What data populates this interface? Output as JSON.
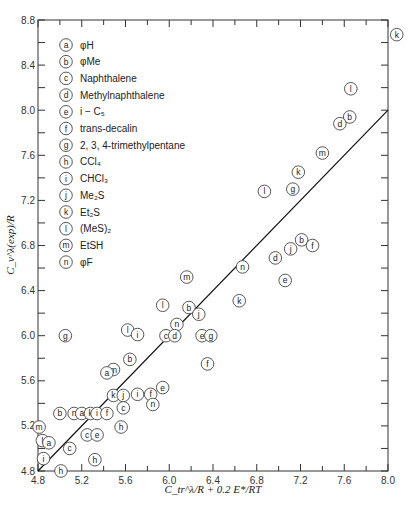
{
  "chart_data": {
    "type": "scatter",
    "title": "",
    "xlabel": "C_tr^λ/R + 0.2 E*/RT",
    "ylabel": "C_v^λ(exp)/R",
    "xlim": [
      4.8,
      8.0
    ],
    "ylim": [
      4.8,
      8.8
    ],
    "xticks": [
      "4.8",
      "5.2",
      "5.6",
      "6.0",
      "6.4",
      "6.8",
      "7.2",
      "7.6",
      "8.0"
    ],
    "yticks": [
      "4.8",
      "5.2",
      "5.6",
      "6.0",
      "6.4",
      "6.8",
      "7.2",
      "7.6",
      "8.0",
      "8.4",
      "8.8"
    ],
    "grid": false,
    "legend_position": "upper-left",
    "legend": [
      {
        "marker": "a",
        "label": "φH"
      },
      {
        "marker": "b",
        "label": "φMe"
      },
      {
        "marker": "c",
        "label": "Naphthalene"
      },
      {
        "marker": "d",
        "label": "Methylnaphthalene"
      },
      {
        "marker": "e",
        "label": "i − C₅"
      },
      {
        "marker": "f",
        "label": "trans-decalin"
      },
      {
        "marker": "g",
        "label": "2, 3, 4-trimethylpentane"
      },
      {
        "marker": "h",
        "label": "CCl₄"
      },
      {
        "marker": "i",
        "label": "CHCl₃"
      },
      {
        "marker": "j",
        "label": "Me₂S"
      },
      {
        "marker": "k",
        "label": "Et₂S"
      },
      {
        "marker": "l",
        "label": "(MeS)₂"
      },
      {
        "marker": "m",
        "label": "EtSH"
      },
      {
        "marker": "n",
        "label": "φF"
      }
    ],
    "reference_line": {
      "label": "y = x",
      "x": [
        4.8,
        8.0
      ],
      "y": [
        4.8,
        8.0
      ]
    },
    "points": [
      {
        "m": "k",
        "x": 8.08,
        "y": 8.67
      },
      {
        "m": "l",
        "x": 7.66,
        "y": 8.19
      },
      {
        "m": "b",
        "x": 7.65,
        "y": 7.94
      },
      {
        "m": "d",
        "x": 7.56,
        "y": 7.88
      },
      {
        "m": "m",
        "x": 7.4,
        "y": 7.62
      },
      {
        "m": "k",
        "x": 7.18,
        "y": 7.45
      },
      {
        "m": "g",
        "x": 7.13,
        "y": 7.3
      },
      {
        "m": "l",
        "x": 6.87,
        "y": 7.28
      },
      {
        "m": "b",
        "x": 7.21,
        "y": 6.85
      },
      {
        "m": "j",
        "x": 7.11,
        "y": 6.77
      },
      {
        "m": "f",
        "x": 7.31,
        "y": 6.8
      },
      {
        "m": "d",
        "x": 6.97,
        "y": 6.69
      },
      {
        "m": "e",
        "x": 7.06,
        "y": 6.49
      },
      {
        "m": "n",
        "x": 6.67,
        "y": 6.61
      },
      {
        "m": "m",
        "x": 6.16,
        "y": 6.52
      },
      {
        "m": "l",
        "x": 5.94,
        "y": 6.27
      },
      {
        "m": "k",
        "x": 6.64,
        "y": 6.31
      },
      {
        "m": "b",
        "x": 6.18,
        "y": 6.25
      },
      {
        "m": "j",
        "x": 6.27,
        "y": 6.19
      },
      {
        "m": "n",
        "x": 6.07,
        "y": 6.1
      },
      {
        "m": "c",
        "x": 5.97,
        "y": 6.0
      },
      {
        "m": "d",
        "x": 6.05,
        "y": 6.0
      },
      {
        "m": "e",
        "x": 6.3,
        "y": 6.0
      },
      {
        "m": "g",
        "x": 6.38,
        "y": 6.0
      },
      {
        "m": "f",
        "x": 6.35,
        "y": 5.75
      },
      {
        "m": "l",
        "x": 5.62,
        "y": 6.05
      },
      {
        "m": "i",
        "x": 5.71,
        "y": 6.01
      },
      {
        "m": "g",
        "x": 5.05,
        "y": 6.0
      },
      {
        "m": "b",
        "x": 5.64,
        "y": 5.79
      },
      {
        "m": "m",
        "x": 5.49,
        "y": 5.7
      },
      {
        "m": "a",
        "x": 5.43,
        "y": 5.67
      },
      {
        "m": "k",
        "x": 5.49,
        "y": 5.47
      },
      {
        "m": "j",
        "x": 5.58,
        "y": 5.47
      },
      {
        "m": "c",
        "x": 5.58,
        "y": 5.36
      },
      {
        "m": "i",
        "x": 5.71,
        "y": 5.48
      },
      {
        "m": "f",
        "x": 5.83,
        "y": 5.48
      },
      {
        "m": "e",
        "x": 5.94,
        "y": 5.54
      },
      {
        "m": "n",
        "x": 5.85,
        "y": 5.39
      },
      {
        "m": "b",
        "x": 5.0,
        "y": 5.31
      },
      {
        "m": "n",
        "x": 5.13,
        "y": 5.31
      },
      {
        "m": "a",
        "x": 5.2,
        "y": 5.31
      },
      {
        "m": "k",
        "x": 5.28,
        "y": 5.31
      },
      {
        "m": "i",
        "x": 5.34,
        "y": 5.31
      },
      {
        "m": "f",
        "x": 5.43,
        "y": 5.31
      },
      {
        "m": "h",
        "x": 5.56,
        "y": 5.19
      },
      {
        "m": "m",
        "x": 4.81,
        "y": 5.19
      },
      {
        "m": "l",
        "x": 4.84,
        "y": 5.07
      },
      {
        "m": "a",
        "x": 4.9,
        "y": 5.05
      },
      {
        "m": "c",
        "x": 5.25,
        "y": 5.12
      },
      {
        "m": "e",
        "x": 5.34,
        "y": 5.12
      },
      {
        "m": "c",
        "x": 5.09,
        "y": 5.0
      },
      {
        "m": "i",
        "x": 4.85,
        "y": 4.91
      },
      {
        "m": "h",
        "x": 5.32,
        "y": 4.9
      },
      {
        "m": "h",
        "x": 5.01,
        "y": 4.8
      }
    ]
  }
}
